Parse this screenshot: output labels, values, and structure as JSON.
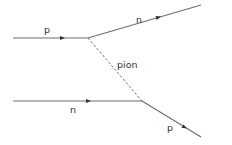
{
  "diagram": {
    "line_color": "#6e6e6e",
    "label_color": "#333333",
    "particles": {
      "incoming_top": {
        "label": "p",
        "x1": 13,
        "y1": 38,
        "x2": 88,
        "y2": 38,
        "arrow_x": 63,
        "arrow_y": 38,
        "label_x": 44,
        "label_y": 33
      },
      "outgoing_top": {
        "label": "n",
        "x1": 88,
        "y1": 38,
        "x2": 201,
        "y2": 5,
        "arrow_x": 159,
        "arrow_y": 17,
        "label_x": 136,
        "label_y": 23
      },
      "exchange": {
        "label": "pion",
        "x1": 88,
        "y1": 38,
        "x2": 142,
        "y2": 101,
        "label_x": 117,
        "label_y": 68
      },
      "incoming_bottom": {
        "label": "n",
        "x1": 13,
        "y1": 101,
        "x2": 142,
        "y2": 101,
        "arrow_x": 89,
        "arrow_y": 101,
        "label_x": 70,
        "label_y": 113
      },
      "outgoing_bottom": {
        "label": "p",
        "x1": 142,
        "y1": 101,
        "x2": 201,
        "y2": 137,
        "arrow_x": 185,
        "arrow_y": 128,
        "label_x": 167,
        "label_y": 131
      }
    }
  }
}
